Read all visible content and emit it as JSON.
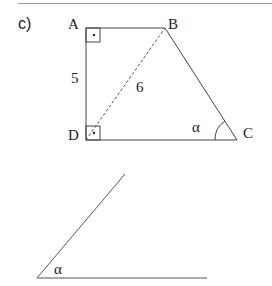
{
  "part_label": "c)",
  "trapezoid": {
    "vertices": {
      "A": "A",
      "B": "B",
      "C": "C",
      "D": "D"
    },
    "side_AD": "5",
    "diagonal_BD": "6",
    "angle_C": "α",
    "right_angles": [
      "A",
      "D"
    ]
  },
  "angle_figure": {
    "angle_label": "α"
  },
  "colors": {
    "line": "#444444",
    "text": "#222222"
  }
}
